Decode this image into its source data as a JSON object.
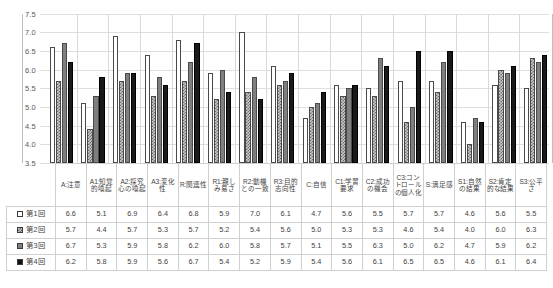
{
  "chart_data": {
    "type": "bar",
    "title": "",
    "xlabel": "",
    "ylabel": "",
    "ylim": [
      3.5,
      7.5
    ],
    "yticks": [
      "7.5",
      "7.0",
      "6.5",
      "6.0",
      "5.5",
      "5.0",
      "4.5",
      "4.0",
      "3.5"
    ],
    "grid": true,
    "legend_position": "data-table-left",
    "categories": [
      "A:注意",
      "A1:知覚的喚起",
      "A2:探究心の喚起",
      "A3:変化性",
      "R:関連性",
      "R1:親しみ易さ",
      "R2:動機との一致",
      "R3:目的志向性",
      "C:自信",
      "C1:学習要求",
      "C2:成功の機会",
      "C3:コントロールの個人化",
      "S:満足感",
      "S1:自然の結果",
      "S2:肯定的な結果",
      "S3:公平さ"
    ],
    "series": [
      {
        "name": "第1回",
        "marker": "white-square",
        "values": [
          6.6,
          5.1,
          6.9,
          6.4,
          6.8,
          5.9,
          7.0,
          6.1,
          4.7,
          5.6,
          5.5,
          5.7,
          5.7,
          4.6,
          5.6,
          5.5
        ]
      },
      {
        "name": "第2回",
        "marker": "checkered-square",
        "values": [
          5.7,
          4.4,
          5.7,
          5.3,
          5.7,
          5.2,
          5.4,
          5.6,
          5.0,
          5.3,
          5.3,
          4.6,
          5.4,
          4.0,
          6.0,
          6.3
        ]
      },
      {
        "name": "第3回",
        "marker": "gray-square",
        "values": [
          6.7,
          5.3,
          5.9,
          5.8,
          6.2,
          6.0,
          5.8,
          5.7,
          5.1,
          5.5,
          6.3,
          5.0,
          6.2,
          4.7,
          5.9,
          6.2
        ]
      },
      {
        "name": "第4回",
        "marker": "black-square",
        "values": [
          6.2,
          5.8,
          5.9,
          5.6,
          6.7,
          5.4,
          5.2,
          5.9,
          5.4,
          5.6,
          6.1,
          6.5,
          6.5,
          4.6,
          6.1,
          6.4
        ]
      }
    ]
  }
}
